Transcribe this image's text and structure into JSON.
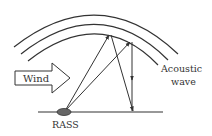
{
  "diagram": {
    "labels": {
      "wind": "Wind",
      "acoustic_line1": "Acoustic",
      "acoustic_line2": "wave",
      "rass": "RASS"
    },
    "colors": {
      "stroke": "#333333",
      "rass_fill": "#555555",
      "background": "#ffffff"
    },
    "elements": {
      "wavefronts": 3,
      "ray_paths": "two upward rays from RASS to wavefront, one reflected back down to ground"
    }
  }
}
